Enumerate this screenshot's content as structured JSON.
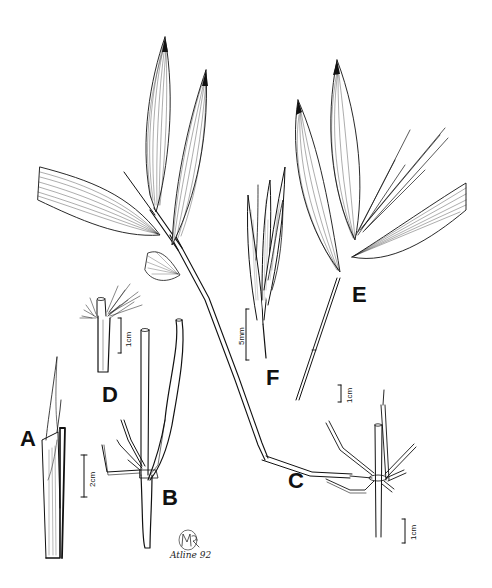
{
  "figure": {
    "type": "botanical line illustration (grass/bamboo plate)",
    "panels": [
      {
        "id": "A",
        "label": "A",
        "depicts": "culm segment with sheath and blade tip",
        "scale": "2cm"
      },
      {
        "id": "B",
        "label": "B",
        "depicts": "node with branch complement",
        "scale": "2cm"
      },
      {
        "id": "C",
        "label": "C",
        "depicts": "node with radiating branches and long branch",
        "scale": "1cm"
      },
      {
        "id": "D",
        "label": "D",
        "depicts": "sheath apex with oral setae",
        "scale": "1cm"
      },
      {
        "id": "E",
        "label": "E",
        "depicts": "leafy branch with spikelets",
        "scale": "1cm"
      },
      {
        "id": "F",
        "label": "F",
        "depicts": "spikelet",
        "scale": "5mm"
      }
    ],
    "scale_bars": {
      "a_b": "2cm",
      "d": "1cm",
      "e": "1cm",
      "f": "5mm",
      "c": "1cm"
    },
    "signature": {
      "monogram": "MR",
      "name": "Atline 92"
    },
    "colors": {
      "ink": "#111111",
      "background": "#ffffff"
    }
  }
}
